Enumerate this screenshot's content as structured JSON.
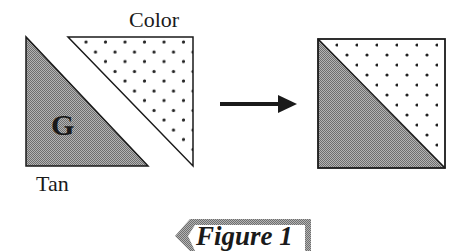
{
  "diagram": {
    "labels": {
      "color": "Color",
      "tan": "Tan",
      "g": "G"
    },
    "figure_caption": "Figure 1",
    "colors": {
      "line": "#1a1a1a",
      "shade": "#9a9a9a",
      "dot": "#222222",
      "caption_border": "#a8a8a8",
      "background": "#ffffff"
    },
    "shapes": {
      "tan_triangle": "shaded half-square triangle labeled G",
      "color_triangle": "dotted half-square triangle",
      "arrow": "right-pointing arrow",
      "result_square": "half-square triangle block: shaded lower-left, dotted upper-right"
    }
  }
}
